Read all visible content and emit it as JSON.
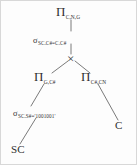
{
  "diagram": {
    "type": "query-tree",
    "background_color": "#fdfdfd",
    "line_color": "#6b6b6b",
    "text_color": "#2f2f2f",
    "nodes": [
      {
        "id": "proj-top",
        "kind": "projection",
        "symbol": "Π",
        "subscript": "C,N,G",
        "x": 70,
        "y": 12
      },
      {
        "id": "select-join",
        "kind": "selection",
        "symbol": "σ",
        "subscript": "SC.C#=C.C#",
        "x": 70,
        "y": 37
      },
      {
        "id": "cross-product",
        "kind": "cross-product",
        "symbol": "×",
        "subscript": "",
        "x": 70,
        "y": 57
      },
      {
        "id": "proj-left",
        "kind": "projection",
        "symbol": "Π",
        "subscript": "G,C#",
        "x": 46,
        "y": 77
      },
      {
        "id": "proj-right",
        "kind": "projection",
        "symbol": "Π",
        "subscript": "C#,CN",
        "x": 93,
        "y": 77
      },
      {
        "id": "select-sno",
        "kind": "selection",
        "symbol": "σ",
        "subscript": "SC.S#='1001001'",
        "x": 40,
        "y": 110
      },
      {
        "id": "rel-sc",
        "kind": "relation",
        "symbol": "SC",
        "subscript": "",
        "x": 19,
        "y": 150
      },
      {
        "id": "rel-c",
        "kind": "relation",
        "symbol": "C",
        "subscript": "",
        "x": 118,
        "y": 125
      }
    ],
    "edges": [
      {
        "from": "proj-top",
        "to": "select-join",
        "x1": 70,
        "y1": 19,
        "x2": 70,
        "y2": 30
      },
      {
        "from": "select-join",
        "to": "cross-product",
        "x1": 70,
        "y1": 43,
        "x2": 70,
        "y2": 53
      },
      {
        "from": "cross-product",
        "to": "proj-left",
        "x1": 67,
        "y1": 60,
        "x2": 51,
        "y2": 72
      },
      {
        "from": "cross-product",
        "to": "proj-right",
        "x1": 74,
        "y1": 60,
        "x2": 89,
        "y2": 72
      },
      {
        "from": "proj-left",
        "to": "select-sno",
        "x1": 43,
        "y1": 82,
        "x2": 31,
        "y2": 104
      },
      {
        "from": "select-sno",
        "to": "rel-sc",
        "x1": 35,
        "y1": 116,
        "x2": 19,
        "y2": 143
      },
      {
        "from": "proj-right",
        "to": "rel-c",
        "x1": 97,
        "y1": 82,
        "x2": 117,
        "y2": 118
      }
    ]
  }
}
